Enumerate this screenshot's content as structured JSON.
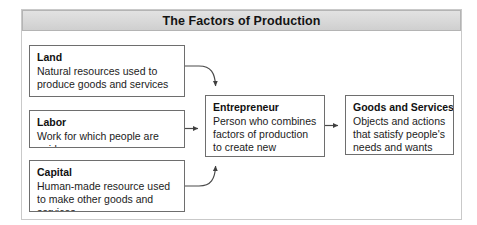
{
  "figure": {
    "title": "The Factors of Production"
  },
  "boxes": {
    "land": {
      "title": "Land",
      "body": "Natural resources used to produce goods and services"
    },
    "labor": {
      "title": "Labor",
      "body": "Work for which people are paid"
    },
    "capital": {
      "title": "Capital",
      "body": "Human-made resource used to make other goods and services"
    },
    "entrepreneur": {
      "title": "Entrepreneur",
      "body": "Person who combines factors of production to create new businesses"
    },
    "goods": {
      "title": "Goods and Services",
      "body": "Objects and actions that satisfy people's needs and wants"
    }
  },
  "connectors": [
    {
      "name": "land-to-entrepreneur",
      "style": "curved",
      "from": "land",
      "to": "entrepreneur"
    },
    {
      "name": "labor-to-entrepreneur",
      "style": "straight",
      "from": "labor",
      "to": "entrepreneur"
    },
    {
      "name": "capital-to-entrepreneur",
      "style": "curved",
      "from": "capital",
      "to": "entrepreneur"
    },
    {
      "name": "entrepreneur-to-goods",
      "style": "straight",
      "from": "entrepreneur",
      "to": "goods"
    }
  ],
  "colors": {
    "title_bar_fill": "#d8d8d8",
    "title_bar_border": "#b4b4b4",
    "box_border": "#6e6e6e",
    "frame_border": "#c9c9c9",
    "connector": "#4a4a4a",
    "text": "#1a1a1a",
    "background": "#ffffff"
  }
}
